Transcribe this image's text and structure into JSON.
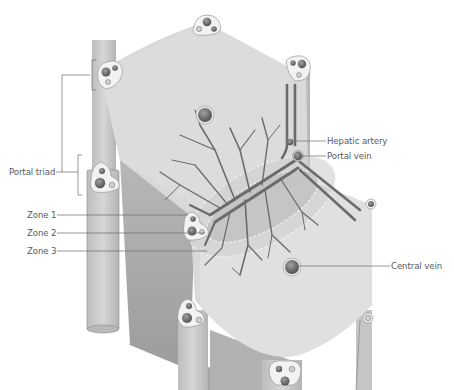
{
  "figure": {
    "colors": {
      "background": "#ffffff",
      "lobule_face": "#dadada",
      "column_light": "#cfcfcf",
      "column_dark": "#a9a9a9",
      "triad_fill": "#f2f2f2",
      "vessel": "#6f6f6f",
      "vessel_dark": "#555555",
      "label_text": "#5a5a5a",
      "leader_line": "#6a6a6a",
      "zone_dash": "#ffffff"
    }
  },
  "labels": {
    "portal_triad": "Portal triad",
    "zone1": "Zone 1",
    "zone2": "Zone 2",
    "zone3": "Zone 3",
    "hepatic_artery": "Hepatic artery",
    "portal_vein": "Portal vein",
    "central_vein": "Central vein"
  }
}
